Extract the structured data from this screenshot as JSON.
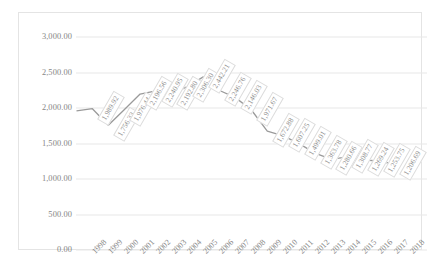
{
  "chart_data": {
    "type": "line",
    "title": "",
    "xlabel": "",
    "ylabel": "",
    "grid": true,
    "legend": "none",
    "ylim": [
      0,
      3000
    ],
    "yticks": [
      "0.00",
      "500.00",
      "1,000.00",
      "1,500.00",
      "2,000.00",
      "2,500.00",
      "3,000.00"
    ],
    "ytick_values": [
      0,
      500,
      1000,
      1500,
      2000,
      2500,
      3000
    ],
    "categories": [
      "1998",
      "1999",
      "2000",
      "2001",
      "2002",
      "2003",
      "2004",
      "2005",
      "2006",
      "2007",
      "2008",
      "2009",
      "2010",
      "2011",
      "2012",
      "2013",
      "2014",
      "2015",
      "2016",
      "2017",
      "2018"
    ],
    "values": [
      1960.0,
      1989.92,
      1756.33,
      1976.44,
      2196.56,
      2240.95,
      2192.8,
      2306.3,
      2442.21,
      2246.76,
      2146.03,
      1971.67,
      1672.88,
      1607.25,
      1499.01,
      1363.78,
      1280.66,
      1308.77,
      1269.24,
      1253.75,
      1206.69
    ],
    "point_labels": [
      "",
      "1,989.92",
      "1,756.33",
      "1,976.44",
      "2,196.56",
      "2,240.95",
      "2,192.80",
      "2,306.30",
      "2,442.21",
      "2,246.76",
      "2,146.03",
      "1,971.67",
      "1,672.88",
      "1,607.25",
      "1,499.01",
      "1,363.78",
      "1,280.66",
      "1,308.77",
      "1,269.24",
      "1,253.75",
      "1,206.69"
    ],
    "series_color": "#9a9a9a",
    "gridline_color": "#e8e8e8",
    "label_border_color": "#dcdcdc",
    "axis_text_color": "#868686"
  }
}
